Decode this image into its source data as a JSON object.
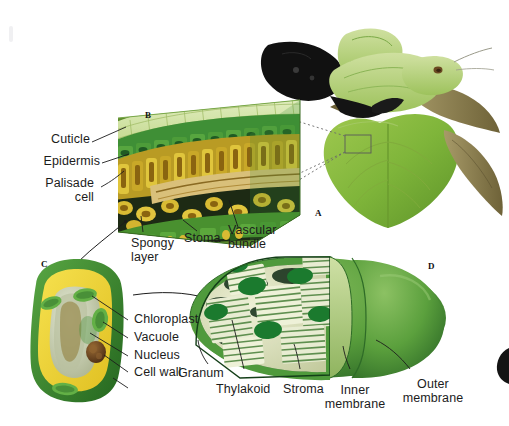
{
  "figure": {
    "background_color": "#ffffff",
    "label_color": "#1c1c1c"
  },
  "panels": [
    {
      "id": "A",
      "name": "leaf-photograph",
      "caption": "A",
      "description": "Photograph of a plant shoot with heart-shaped leaves"
    },
    {
      "id": "B",
      "name": "leaf-cross-section",
      "caption": "B",
      "description": "Three-dimensional block diagram of a leaf cross section"
    },
    {
      "id": "C",
      "name": "plant-cell",
      "caption": "C",
      "description": "Cut-away diagram of a single palisade/plant cell"
    },
    {
      "id": "D",
      "name": "chloroplast",
      "caption": "D",
      "description": "Cut-away diagram of a chloroplast"
    }
  ],
  "labels": {
    "leaf_section": [
      {
        "key": "cuticle",
        "text": "Cuticle"
      },
      {
        "key": "epidermis",
        "text": "Epidermis"
      },
      {
        "key": "palisade_cell",
        "text": "Palisade\ncell"
      },
      {
        "key": "spongy_layer",
        "text": "Spongy\nlayer"
      },
      {
        "key": "stoma",
        "text": "Stoma"
      },
      {
        "key": "vascular_bundle",
        "text": "Vascular\nbundle"
      }
    ],
    "cell": [
      {
        "key": "chloroplast",
        "text": "Chloroplast"
      },
      {
        "key": "vacuole",
        "text": "Vacuole"
      },
      {
        "key": "nucleus",
        "text": "Nucleus"
      },
      {
        "key": "cell_wall",
        "text": "Cell wall"
      }
    ],
    "chloroplast": [
      {
        "key": "granum",
        "text": "Granum"
      },
      {
        "key": "thylakoid",
        "text": "Thylakoid"
      },
      {
        "key": "stroma",
        "text": "Stroma"
      },
      {
        "key": "inner_membrane",
        "text": "Inner\nmembrane"
      },
      {
        "key": "outer_membrane",
        "text": "Outer\nmembrane"
      }
    ]
  },
  "label_text": {
    "cuticle": "Cuticle",
    "epidermis": "Epidermis",
    "palisade_line1": "Palisade",
    "palisade_line2": "cell",
    "spongy_line1": "Spongy",
    "spongy_line2": "layer",
    "stoma": "Stoma",
    "vascular_line1": "Vascular",
    "vascular_line2": "bundle",
    "chloroplast": "Chloroplast",
    "vacuole": "Vacuole",
    "nucleus": "Nucleus",
    "cell_wall": "Cell wall",
    "granum": "Granum",
    "thylakoid": "Thylakoid",
    "stroma": "Stroma",
    "inner_line1": "Inner",
    "inner_line2": "membrane",
    "outer_line1": "Outer",
    "outer_line2": "membrane",
    "panel_a": "A",
    "panel_b": "B",
    "panel_c": "C",
    "panel_d": "D"
  },
  "colors": {
    "leaf_dark_green": "#2f7d32",
    "leaf_mid_green": "#7fb03a",
    "leaf_light_green": "#c9dd9a",
    "palisade_yellow": "#d9b933",
    "palisade_orange": "#a97c18",
    "air_space_dark": "#1d2a14",
    "vascular_tan": "#d9c07a",
    "cell_yellow": "#f0d63c",
    "cell_wall_green": "#3f8f36",
    "vacuole_pale": "#cfd6bd",
    "nucleus_brown": "#6b4420",
    "chloroplast_green": "#4f9a3c",
    "chloroplast_dark": "#1f5a23",
    "stroma_cream": "#dfe3c4",
    "thylakoid_green": "#1b7a2e",
    "stem_brown": "#8a7d50",
    "silhouette": "#111111"
  }
}
